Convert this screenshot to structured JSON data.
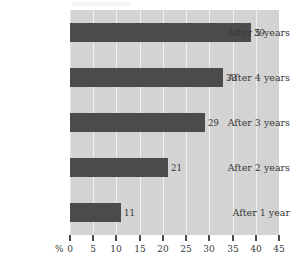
{
  "chart_data": {
    "type": "bar",
    "orientation": "horizontal",
    "title": "",
    "subtitle": "",
    "xlabel": "%",
    "ylabel": "",
    "categories": [
      "After 1 year",
      "After 2 years",
      "After 3 years",
      "After 4 years",
      "After 5 years"
    ],
    "values": [
      11,
      21,
      29,
      33,
      39
    ],
    "data_labels": [
      "11",
      "21",
      "29",
      "33",
      "39"
    ],
    "xlim": [
      0,
      45
    ],
    "xticks": [
      0,
      5,
      10,
      15,
      20,
      25,
      30,
      35,
      40,
      45
    ],
    "xtick_labels": [
      "0",
      "5",
      "10",
      "15",
      "20",
      "25",
      "30",
      "35",
      "40",
      "45"
    ],
    "grid": true,
    "grid_axis": "x",
    "legend": false,
    "legend_position": "none",
    "colors": {
      "bar": "#4b4b4b",
      "plot_background": "#d3d3d3",
      "gridline": "#f0f0f0",
      "text": "#3a3a3a",
      "page_background": "#ffffff"
    }
  },
  "axis": {
    "unit_label": "%"
  }
}
